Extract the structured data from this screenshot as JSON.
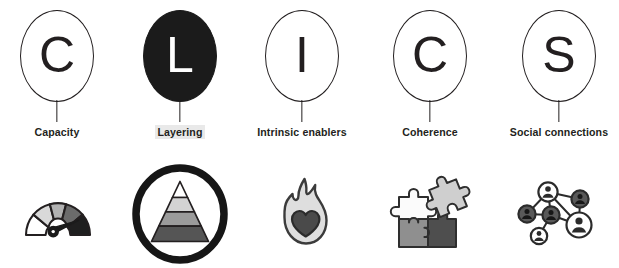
{
  "graphic": {
    "title": "CLICS",
    "acronym_items": [
      {
        "letter": "C",
        "label": "Capacity",
        "letter_style": "outline",
        "highlighted": false,
        "icon_name": "gauge-icon"
      },
      {
        "letter": "L",
        "label": "Layering",
        "letter_style": "filled",
        "highlighted": true,
        "icon_name": "pyramid-in-circle-icon"
      },
      {
        "letter": "I",
        "label": "Intrinsic enablers",
        "letter_style": "outline",
        "highlighted": false,
        "icon_name": "flame-heart-icon"
      },
      {
        "letter": "C",
        "label": "Coherence",
        "letter_style": "outline",
        "highlighted": false,
        "icon_name": "jigsaw-puzzle-icon"
      },
      {
        "letter": "S",
        "label": "Social connections",
        "letter_style": "outline",
        "highlighted": false,
        "icon_name": "social-network-icon"
      }
    ],
    "colors": {
      "ink": "#231f20",
      "filled_bubble": "#1b1b1b",
      "bubble_fill": "#ffffff",
      "label_highlight": "#e9e9e9",
      "background": "#ffffff",
      "gray_light": "#d8d8d8",
      "gray_mid": "#a8a8a8",
      "gray_dark": "#6e6e6e",
      "gray_darkest": "#3f3f3f"
    }
  }
}
